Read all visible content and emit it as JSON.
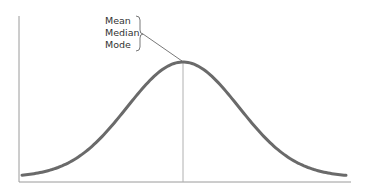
{
  "diagram": {
    "type": "normal-distribution",
    "labels": [
      "Mean",
      "Median",
      "Mode"
    ],
    "annotation_target": "peak of curve",
    "colors": {
      "curve": "#6a6a6a",
      "axis": "#9a9a9a",
      "center_line": "#b0b0b0",
      "text": "#333333",
      "background": "#ffffff"
    }
  },
  "chart_data": {
    "type": "line",
    "title": "",
    "xlabel": "",
    "ylabel": "",
    "series": [
      {
        "name": "normal curve",
        "shape": "gaussian",
        "center": 0,
        "values_relative": [
          0.02,
          0.1,
          0.33,
          0.67,
          1.0,
          0.67,
          0.33,
          0.1,
          0.02
        ]
      }
    ],
    "x": [
      -4,
      -3,
      -2,
      -1,
      0,
      1,
      2,
      3,
      4
    ],
    "annotations": [
      "Mean",
      "Median",
      "Mode"
    ],
    "grid": false
  }
}
